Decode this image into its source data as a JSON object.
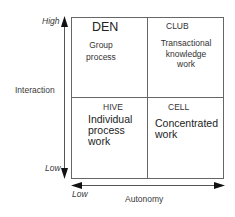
{
  "diagram": {
    "type": "2x2-matrix",
    "y_axis": {
      "label": "Interaction",
      "high_label": "High",
      "low_label": "Low"
    },
    "x_axis": {
      "label": "Autonomy",
      "low_label": "Low"
    },
    "quadrants": [
      {
        "position": "top-left",
        "title": "DEN",
        "description_lines": [
          "Group",
          "process"
        ]
      },
      {
        "position": "top-right",
        "title": "CLUB",
        "description_lines": [
          "Transactional",
          "knowledge",
          "work"
        ]
      },
      {
        "position": "bottom-left",
        "title": "HIVE",
        "description_lines": [
          "Individual",
          "process",
          "work"
        ]
      },
      {
        "position": "bottom-right",
        "title": "CELL",
        "description_lines": [
          "Concentrated",
          "work"
        ]
      }
    ],
    "colors": {
      "line": "#555555",
      "arrow": "#111111",
      "text": "#2a2a2a",
      "background": "#ffffff"
    }
  }
}
